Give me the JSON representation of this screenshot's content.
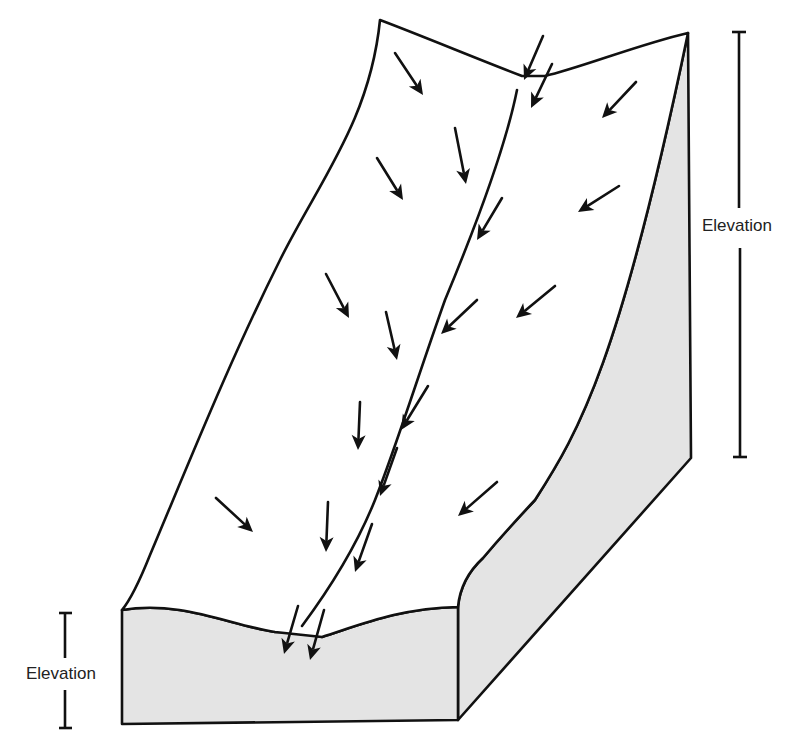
{
  "diagram": {
    "labels": {
      "right_elevation": "Elevation",
      "left_elevation": "Elevation"
    },
    "colors": {
      "outline": "#111111",
      "side_face": "#e4e4e4",
      "top_face": "#ffffff",
      "text": "#222222"
    },
    "arrows": [
      {
        "x1": 395,
        "y1": 53,
        "x2": 423,
        "y2": 95
      },
      {
        "x1": 543,
        "y1": 36,
        "x2": 524,
        "y2": 80
      },
      {
        "x1": 552,
        "y1": 64,
        "x2": 531,
        "y2": 108
      },
      {
        "x1": 636,
        "y1": 82,
        "x2": 602,
        "y2": 118
      },
      {
        "x1": 377,
        "y1": 158,
        "x2": 403,
        "y2": 200
      },
      {
        "x1": 455,
        "y1": 128,
        "x2": 466,
        "y2": 184
      },
      {
        "x1": 502,
        "y1": 198,
        "x2": 477,
        "y2": 240
      },
      {
        "x1": 619,
        "y1": 186,
        "x2": 578,
        "y2": 212
      },
      {
        "x1": 326,
        "y1": 274,
        "x2": 349,
        "y2": 318
      },
      {
        "x1": 386,
        "y1": 312,
        "x2": 397,
        "y2": 360
      },
      {
        "x1": 477,
        "y1": 300,
        "x2": 441,
        "y2": 334
      },
      {
        "x1": 555,
        "y1": 286,
        "x2": 516,
        "y2": 318
      },
      {
        "x1": 360,
        "y1": 402,
        "x2": 358,
        "y2": 450
      },
      {
        "x1": 428,
        "y1": 386,
        "x2": 401,
        "y2": 430
      },
      {
        "x1": 397,
        "y1": 448,
        "x2": 380,
        "y2": 496
      },
      {
        "x1": 497,
        "y1": 482,
        "x2": 458,
        "y2": 516
      },
      {
        "x1": 216,
        "y1": 498,
        "x2": 253,
        "y2": 532
      },
      {
        "x1": 328,
        "y1": 502,
        "x2": 326,
        "y2": 552
      },
      {
        "x1": 372,
        "y1": 524,
        "x2": 355,
        "y2": 572
      },
      {
        "x1": 298,
        "y1": 606,
        "x2": 284,
        "y2": 654
      },
      {
        "x1": 324,
        "y1": 610,
        "x2": 310,
        "y2": 660
      }
    ]
  }
}
